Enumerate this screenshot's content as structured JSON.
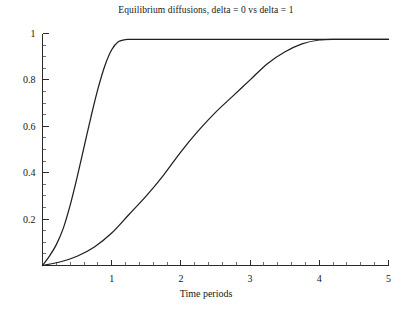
{
  "chart_data": {
    "type": "line",
    "title": "Equilibrium diffusions, delta = 0 vs delta = 1",
    "xlabel": "Time periods",
    "ylabel": "",
    "xlim": [
      0,
      5
    ],
    "ylim": [
      0,
      1.02
    ],
    "grid": false,
    "legend": "none",
    "xticks": [
      1,
      2,
      3,
      4,
      5
    ],
    "xtick_labels": [
      "1",
      "2",
      "3",
      "4",
      "5"
    ],
    "yticks": [
      0.2,
      0.4,
      0.6,
      0.8,
      1
    ],
    "ytick_labels": [
      "0.2",
      "0.4",
      "0.6",
      "0.8",
      "1"
    ],
    "x_minor_tick_step": 0.2,
    "y_minor_tick_step": 0.05,
    "plateau_value": 0.975,
    "series": [
      {
        "name": "delta = 0",
        "color": "#1f1f1f",
        "x": [
          0,
          0.1,
          0.2,
          0.3,
          0.4,
          0.5,
          0.6,
          0.7,
          0.8,
          0.9,
          1.0,
          1.1,
          1.2,
          1.25,
          1.3,
          1.5,
          2.0,
          2.5,
          3.0,
          3.5,
          4.0,
          4.5,
          5.0
        ],
        "values": [
          0.0,
          0.04,
          0.09,
          0.16,
          0.26,
          0.38,
          0.51,
          0.64,
          0.76,
          0.86,
          0.93,
          0.965,
          0.974,
          0.975,
          0.975,
          0.975,
          0.975,
          0.975,
          0.975,
          0.975,
          0.975,
          0.975,
          0.975
        ]
      },
      {
        "name": "delta = 1",
        "color": "#1f1f1f",
        "x": [
          0,
          0.25,
          0.5,
          0.75,
          1.0,
          1.25,
          1.5,
          1.75,
          2.0,
          2.25,
          2.5,
          2.75,
          3.0,
          3.25,
          3.5,
          3.75,
          4.0,
          4.25,
          4.5,
          4.75,
          5.0
        ],
        "values": [
          0.0,
          0.015,
          0.04,
          0.08,
          0.14,
          0.22,
          0.3,
          0.39,
          0.49,
          0.58,
          0.66,
          0.73,
          0.8,
          0.87,
          0.92,
          0.955,
          0.972,
          0.975,
          0.975,
          0.975,
          0.975
        ]
      }
    ]
  },
  "axes": {
    "origin_label": ""
  }
}
